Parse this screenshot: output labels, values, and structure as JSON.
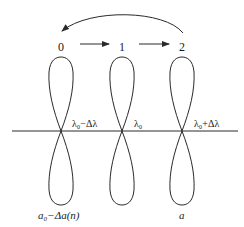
{
  "diagram": {
    "states": [
      {
        "label": "0",
        "wavelength_label": "λ₀−Δλ",
        "bottom_label": "a₀−Δa(n)"
      },
      {
        "label": "1",
        "wavelength_label": "λ₀",
        "bottom_label": ""
      },
      {
        "label": "2",
        "wavelength_label": "λ₀+Δλ",
        "bottom_label": "a"
      }
    ],
    "arrows": [
      {
        "from": "0",
        "to": "1",
        "type": "straight"
      },
      {
        "from": "1",
        "to": "2",
        "type": "straight"
      },
      {
        "from": "2",
        "to": "0",
        "type": "curved"
      }
    ],
    "colors": {
      "stroke": "#2a2a2a",
      "background": "#ffffff"
    }
  }
}
